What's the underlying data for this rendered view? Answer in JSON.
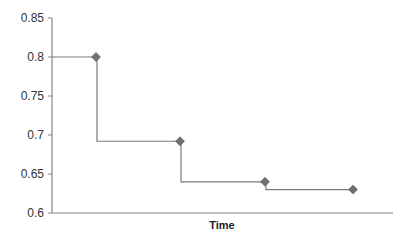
{
  "chart_data": {
    "type": "line",
    "subtype": "step",
    "title": "",
    "xlabel": "Time",
    "ylabel": "",
    "ylim": [
      0.6,
      0.85
    ],
    "yticks": [
      0.6,
      0.65,
      0.7,
      0.75,
      0.8,
      0.85
    ],
    "ytick_labels": [
      "0.6",
      "0.65",
      "0.7",
      "0.75",
      "0.8",
      "0.85"
    ],
    "grid": false,
    "legend": null,
    "series": [
      {
        "name": "",
        "marker": "diamond",
        "color": "#707070",
        "x": [
          1,
          2,
          3,
          4
        ],
        "values": [
          0.8,
          0.692,
          0.64,
          0.63
        ]
      }
    ]
  },
  "colors": {
    "line": "#7a7a7a",
    "marker": "#707070",
    "axis": "#888888",
    "text": "#333333"
  }
}
